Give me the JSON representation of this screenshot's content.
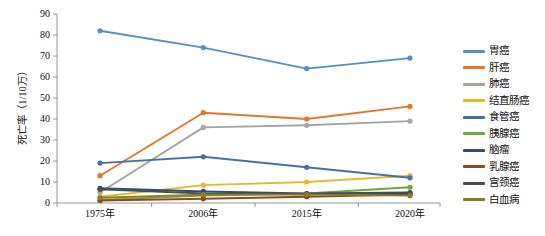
{
  "chart_data": {
    "type": "line",
    "title": "",
    "xlabel": "",
    "ylabel": "死亡率（1/10万）",
    "categories": [
      "1975年",
      "2006年",
      "2015年",
      "2020年"
    ],
    "ylim": [
      0,
      90
    ],
    "ytick_values": [
      0,
      10,
      20,
      30,
      40,
      50,
      60,
      70,
      80,
      90
    ],
    "ytick_labels": [
      "0",
      "10",
      "20",
      "30",
      "40",
      "50",
      "60",
      "70",
      "80",
      "90"
    ],
    "grid": false,
    "legend_position": "right",
    "markers": true,
    "series": [
      {
        "name": "胃癌",
        "color": "#5B8DC2",
        "values": [
          82,
          74,
          64,
          69
        ]
      },
      {
        "name": "肝癌",
        "color": "#E0772B",
        "values": [
          13,
          43,
          40,
          46
        ]
      },
      {
        "name": "肺癌",
        "color": "#A5A5A0",
        "values": [
          5,
          36,
          37,
          39
        ]
      },
      {
        "name": "结直肠癌",
        "color": "#E8B731",
        "values": [
          3,
          8.5,
          10,
          13
        ]
      },
      {
        "name": "食管癌",
        "color": "#4A6FA8",
        "values": [
          19,
          22,
          17,
          12
        ]
      },
      {
        "name": "胰腺癌",
        "color": "#70A73C",
        "values": [
          1.5,
          3.5,
          4.5,
          7.5
        ]
      },
      {
        "name": "脑瘤",
        "color": "#2D4F72",
        "values": [
          7,
          5.5,
          4.5,
          5
        ]
      },
      {
        "name": "乳腺癌",
        "color": "#8C4A20",
        "values": [
          1.2,
          2.0,
          3.0,
          4.0
        ]
      },
      {
        "name": "宫颈癌",
        "color": "#4C4C48",
        "values": [
          6.5,
          4.5,
          4.2,
          4.5
        ]
      },
      {
        "name": "白血病",
        "color": "#8E7B22",
        "values": [
          2.5,
          4.0,
          4.0,
          3.5
        ]
      }
    ]
  },
  "legend": {
    "items": [
      {
        "label": "胃癌"
      },
      {
        "label": "肝癌"
      },
      {
        "label": "肺癌"
      },
      {
        "label": "结直肠癌"
      },
      {
        "label": "食管癌"
      },
      {
        "label": "胰腺癌"
      },
      {
        "label": "脑瘤"
      },
      {
        "label": "乳腺癌"
      },
      {
        "label": "宫颈癌"
      },
      {
        "label": "白血病"
      }
    ]
  }
}
